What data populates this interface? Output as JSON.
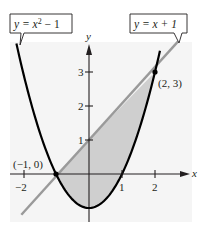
{
  "figure": {
    "background": "#ffffff",
    "panel_color": "#f5f5f5",
    "shade_color": "#cfcfcf",
    "curve_color": "#000000",
    "line_color": "#9a9a9a",
    "axis": {
      "x_label": "x",
      "y_label": "y",
      "x_ticks": [
        {
          "value": -2,
          "label": "−2"
        },
        {
          "value": 1,
          "label": "1"
        },
        {
          "value": 2,
          "label": "2"
        }
      ],
      "y_ticks": [
        {
          "value": 1,
          "label": "1"
        },
        {
          "value": 2,
          "label": "2"
        },
        {
          "value": 3,
          "label": "3"
        }
      ]
    },
    "callouts": {
      "parabola": {
        "prefix": "y = x",
        "sup": "2",
        "suffix": " − 1"
      },
      "line": {
        "text": "y = x + 1"
      }
    },
    "points": [
      {
        "label": "(−1, 0)",
        "x": -1,
        "y": 0
      },
      {
        "label": "(2, 3)",
        "x": 2,
        "y": 3
      }
    ],
    "curves": [
      {
        "name": "parabola",
        "equation": "y = x^2 - 1"
      },
      {
        "name": "line",
        "equation": "y = x + 1"
      }
    ],
    "shaded_region": "between y = x + 1 (top) and y = x^2 - 1 (bottom) for -1 <= x <= 2"
  }
}
